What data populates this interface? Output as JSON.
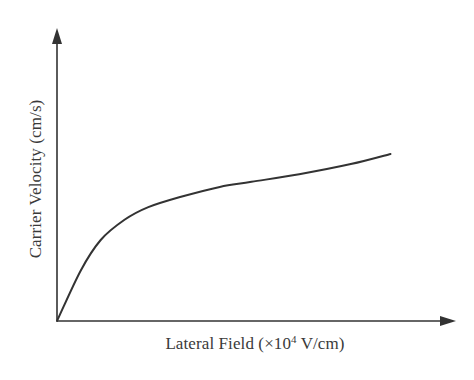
{
  "chart_data": {
    "type": "line",
    "title": "",
    "xlabel": "Lateral Field (×10^4 V/cm)",
    "ylabel": "Carrier Velocity (cm/s)",
    "xlabel_parts": {
      "prefix": "Lateral Field (×10",
      "superscript": "4",
      "suffix": " V/cm)"
    },
    "x_ticks": [],
    "y_ticks": [],
    "grid": false,
    "legend": null,
    "axis_arrows": true,
    "xlim": [
      0,
      1
    ],
    "ylim": [
      0,
      1
    ],
    "series": [
      {
        "name": "carrier velocity vs lateral field",
        "color": "#333333",
        "x": [
          0.0,
          0.06,
          0.11,
          0.17,
          0.23,
          0.31,
          0.41,
          0.49,
          0.61,
          0.74,
          0.84
        ],
        "y": [
          0.0,
          0.2,
          0.32,
          0.4,
          0.45,
          0.49,
          0.53,
          0.55,
          0.58,
          0.62,
          0.66
        ]
      }
    ]
  },
  "colors": {
    "axis": "#333333",
    "curve": "#333333",
    "text": "#3a3a3a",
    "background": "#ffffff"
  }
}
